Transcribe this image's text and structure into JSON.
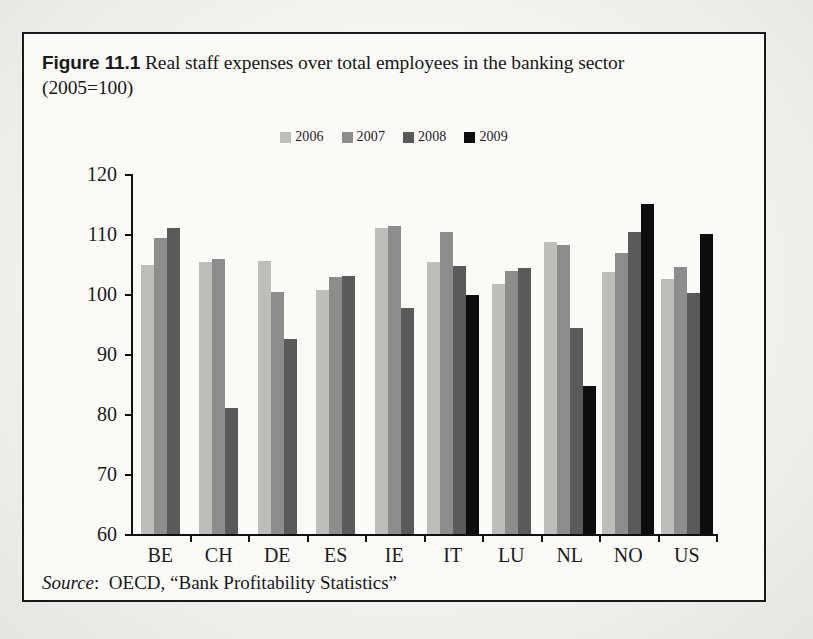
{
  "figure": {
    "number_label": "Figure 11.1",
    "caption_line1": "Real staff expenses over total employees in the banking sector",
    "caption_line2": "(2005=100)",
    "source_word": "Source",
    "source_sep": ":",
    "source_text": "OECD, “Bank Profitability Statistics”"
  },
  "colors": {
    "y2006": "#bdbdba",
    "y2007": "#8d8d8b",
    "y2008": "#5a5a59",
    "y2009": "#0d0d0d",
    "axis": "#111111",
    "border": "#1a1a1a",
    "paper": "#fbfaf7"
  },
  "chart_data": {
    "type": "bar",
    "title": "Real staff expenses over total employees in the banking sector (2005=100)",
    "subtitle": "(2005=100)",
    "xlabel": "",
    "ylabel": "",
    "ylim": [
      60,
      120
    ],
    "yticks": [
      60,
      70,
      80,
      90,
      100,
      110,
      120
    ],
    "ytick_labels": [
      "60",
      "70",
      "80",
      "90",
      "100",
      "110",
      "120"
    ],
    "grid": false,
    "legend_position": "top-center",
    "categories": [
      "BE",
      "CH",
      "DE",
      "ES",
      "IE",
      "IT",
      "LU",
      "NL",
      "NO",
      "US"
    ],
    "series": [
      {
        "name": "2006",
        "color": "#bdbdba",
        "values": [
          104.8,
          105.3,
          105.5,
          100.6,
          111.0,
          105.3,
          101.7,
          108.6,
          103.7,
          102.5
        ]
      },
      {
        "name": "2007",
        "color": "#8d8d8b",
        "values": [
          109.3,
          105.9,
          100.3,
          102.9,
          111.4,
          110.4,
          103.8,
          108.2,
          106.8,
          104.5
        ]
      },
      {
        "name": "2008",
        "color": "#5a5a59",
        "values": [
          111.0,
          81.0,
          92.5,
          103.0,
          97.6,
          104.6,
          104.4,
          94.3,
          110.3,
          100.2
        ]
      },
      {
        "name": "2009",
        "color": "#0d0d0d",
        "values": [
          null,
          null,
          null,
          null,
          null,
          99.8,
          null,
          84.6,
          115.0,
          110.0
        ]
      }
    ],
    "source": "OECD, “Bank Profitability Statistics”"
  },
  "legend": {
    "items": [
      {
        "label": "2006",
        "color": "#bdbdba"
      },
      {
        "label": "2007",
        "color": "#8d8d8b"
      },
      {
        "label": "2008",
        "color": "#5a5a59"
      },
      {
        "label": "2009",
        "color": "#0d0d0d"
      }
    ]
  }
}
